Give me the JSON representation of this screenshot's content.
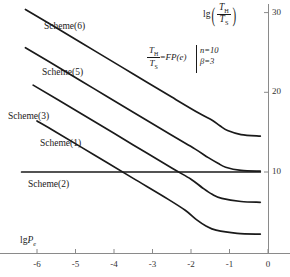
{
  "chart_data": {
    "type": "line",
    "title": "",
    "xlabel": "lg P_e",
    "ylabel": "lg (T_H / T_S)",
    "xlim": [
      -6.8,
      0.2
    ],
    "ylim": [
      0.0,
      32.0
    ],
    "grid": false,
    "legend": "inline-labels",
    "xticks": [
      -6,
      -5,
      -4,
      -3,
      -2,
      -1,
      0
    ],
    "xtick_labels": [
      "-6",
      "-5",
      "-4",
      "-3",
      "-2",
      "-1",
      "0"
    ],
    "yticks": [
      10,
      20,
      30
    ],
    "ytick_labels": [
      "10",
      "20",
      "30"
    ],
    "annotations": [
      {
        "name": "equation",
        "text": "T_H/T_S = FP(e)"
      },
      {
        "name": "parameter-n",
        "text": "n=10"
      },
      {
        "name": "parameter-beta",
        "text": "β=3"
      }
    ],
    "series": [
      {
        "name": "Scheme(6)",
        "label": "Scheme(6)",
        "color": "#1a1a1a",
        "x": [
          -6.3,
          -5.5,
          -4.5,
          -3.5,
          -2.5,
          -1.8,
          -1.45,
          -1.25,
          -1.05,
          -0.7,
          -0.2
        ],
        "y": [
          30.4,
          28.1,
          25.2,
          22.3,
          19.4,
          17.4,
          16.5,
          15.8,
          15.2,
          14.7,
          14.5
        ]
      },
      {
        "name": "Scheme(5)",
        "label": "Scheme(5)",
        "color": "#1a1a1a",
        "x": [
          -6.3,
          -5.5,
          -4.5,
          -3.5,
          -2.5,
          -1.9,
          -1.55,
          -1.3,
          -1.1,
          -0.7,
          -0.2
        ],
        "y": [
          25.6,
          23.3,
          20.4,
          17.5,
          14.6,
          12.9,
          11.8,
          11.1,
          10.6,
          10.2,
          10.1
        ]
      },
      {
        "name": "Scheme(3)",
        "label": "Scheme(3)",
        "color": "#1a1a1a",
        "x": [
          -6.1,
          -5.5,
          -4.5,
          -3.5,
          -2.5,
          -2.0,
          -1.7,
          -1.45,
          -1.2,
          -0.7,
          -0.2
        ],
        "y": [
          20.9,
          19.2,
          16.3,
          13.4,
          10.5,
          9.1,
          8.0,
          7.2,
          6.7,
          6.3,
          6.2
        ]
      },
      {
        "name": "Scheme(1)",
        "label": "Scheme(1)",
        "color": "#1a1a1a",
        "x": [
          -6.0,
          -5.5,
          -4.5,
          -3.5,
          -2.6,
          -2.15,
          -1.85,
          -1.6,
          -1.35,
          -0.8,
          -0.2
        ],
        "y": [
          16.4,
          15.0,
          12.1,
          9.2,
          6.6,
          5.2,
          4.0,
          3.2,
          2.7,
          2.3,
          2.2
        ]
      },
      {
        "name": "Scheme(2)",
        "label": "Scheme(2)",
        "color": "#1a1a1a",
        "x": [
          -6.4,
          -0.2
        ],
        "y": [
          10.0,
          10.0
        ]
      }
    ]
  },
  "axis": {
    "x_title_lg": "lg",
    "x_title_var": "P",
    "x_title_sub": "e",
    "y_title_lg": "lg",
    "y_title_num": "T",
    "y_title_num_sub": "H",
    "y_title_den": "T",
    "y_title_den_sub": "S"
  },
  "equation": {
    "num": "T",
    "num_sub": "H",
    "den": "T",
    "den_sub": "S",
    "equals": "=",
    "rhs": "FP(e)",
    "param_n": "n=10",
    "param_beta": "β=3"
  },
  "colors": {
    "curve": "#1a1a1a",
    "axis": "#8a8a8a",
    "text": "#1a1a1a",
    "background": "#ffffff"
  }
}
